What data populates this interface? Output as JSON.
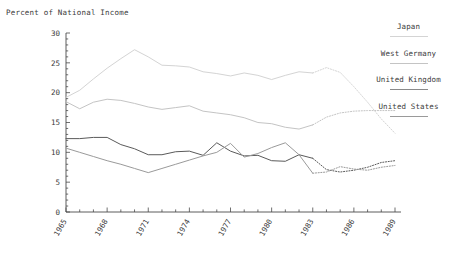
{
  "chart_data": {
    "type": "line",
    "title": "Percent of National Income",
    "xlabel": "",
    "ylabel": "Percent of National Income",
    "ylim": [
      0,
      30
    ],
    "xlim": [
      1965,
      1989
    ],
    "yticks": [
      0,
      5,
      10,
      15,
      20,
      25,
      30
    ],
    "yticks_minor_step": 1,
    "xticks": [
      1965,
      1968,
      1971,
      1974,
      1977,
      1980,
      1983,
      1986,
      1989
    ],
    "xticks_minor_step": 1,
    "grid": false,
    "legend_position": "right",
    "projection_start_year": 1983,
    "x": [
      1965,
      1966,
      1967,
      1968,
      1969,
      1970,
      1971,
      1972,
      1973,
      1974,
      1975,
      1976,
      1977,
      1978,
      1979,
      1980,
      1981,
      1982,
      1983,
      1984,
      1985,
      1986,
      1987,
      1988,
      1989
    ],
    "series": [
      {
        "name": "Japan",
        "color": "#d4d4d4",
        "values": [
          19.2,
          20.4,
          22.3,
          24.1,
          25.7,
          27.2,
          26.0,
          24.6,
          24.5,
          24.3,
          23.5,
          23.2,
          22.8,
          23.3,
          22.9,
          22.2,
          22.9,
          23.5,
          23.3,
          24.2,
          23.4,
          21.0,
          18.4,
          15.6,
          13.2
        ]
      },
      {
        "name": "West Germany",
        "color": "#c4c4c4",
        "values": [
          18.5,
          17.3,
          18.4,
          18.9,
          18.7,
          18.2,
          17.6,
          17.2,
          17.5,
          17.8,
          16.9,
          16.6,
          16.3,
          15.8,
          15.0,
          14.8,
          14.2,
          13.9,
          14.6,
          15.9,
          16.6,
          16.9,
          17.0,
          17.0,
          17.0
        ]
      },
      {
        "name": "United Kingdom",
        "color": "#5a5a5a",
        "values": [
          12.3,
          12.3,
          12.5,
          12.5,
          11.3,
          10.6,
          9.6,
          9.6,
          10.1,
          10.2,
          9.5,
          11.6,
          10.2,
          9.4,
          9.5,
          8.6,
          8.5,
          9.6,
          9.0,
          7.1,
          6.7,
          7.0,
          7.5,
          8.3,
          8.6
        ]
      },
      {
        "name": "United States",
        "color": "#9a9a9a",
        "values": [
          10.7,
          10.0,
          9.3,
          8.6,
          8.0,
          7.3,
          6.6,
          7.3,
          8.0,
          8.7,
          9.4,
          10.0,
          11.5,
          9.2,
          9.8,
          10.8,
          11.6,
          9.6,
          6.5,
          6.7,
          7.6,
          7.2,
          7.0,
          7.5,
          7.8
        ]
      }
    ]
  },
  "legend": {
    "entries": [
      {
        "label": "Japan",
        "color": "#d4d4d4"
      },
      {
        "label": "West Germany",
        "color": "#c4c4c4"
      },
      {
        "label": "United Kingdom",
        "color": "#8a8a8a"
      },
      {
        "label": "United States",
        "color": "#9a9a9a"
      }
    ]
  },
  "axis": {
    "title": "Percent of National Income",
    "y_labels": [
      "0",
      "5",
      "10",
      "15",
      "20",
      "25",
      "30"
    ],
    "x_labels": [
      "1965",
      "1968",
      "1971",
      "1974",
      "1977",
      "1980",
      "1983",
      "1986",
      "1989"
    ]
  }
}
